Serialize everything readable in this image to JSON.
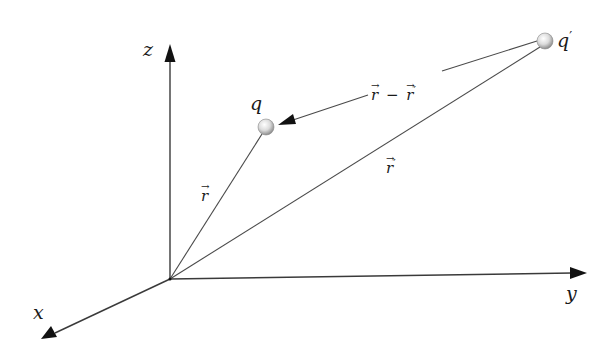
{
  "diagram": {
    "title": "",
    "axes": {
      "z": {
        "label": "z"
      },
      "y": {
        "label": "y"
      },
      "x": {
        "label": "x"
      }
    },
    "charges": {
      "q": {
        "label": "q"
      },
      "q_prime": {
        "label": "q",
        "prime": "′"
      }
    },
    "vectors": {
      "r": {
        "symbol": "r",
        "arrow": "→"
      },
      "r_prime": {
        "symbol": "r",
        "arrow": "→",
        "prime": "′"
      },
      "r_minus_r_prime": {
        "a": "r",
        "op": "−",
        "b": "r",
        "arrow": "→",
        "prime": "′"
      }
    },
    "colors": {
      "line": "#3a3a3a",
      "sphere_light": "#f4f4f4",
      "sphere_dark": "#9a9a9a",
      "text": "#1a1a1a"
    }
  }
}
